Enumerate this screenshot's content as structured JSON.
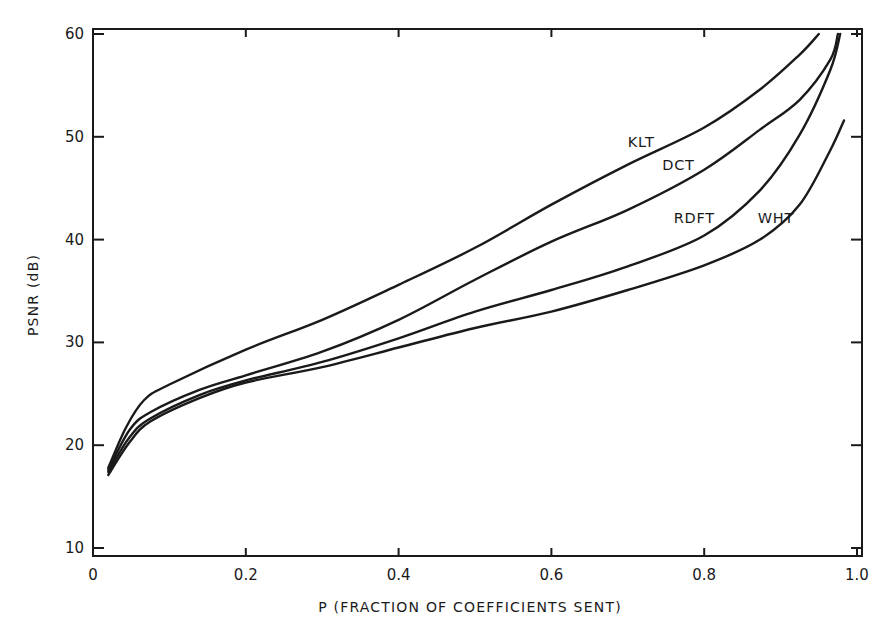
{
  "chart_data": {
    "type": "line",
    "title": "",
    "xlabel": "P (FRACTION OF COEFFICIENTS SENT)",
    "ylabel": "PSNR (dB)",
    "xlim": [
      0,
      1.0
    ],
    "ylim": [
      10,
      60
    ],
    "grid": false,
    "legend": "inline labels near curves",
    "x_ticks": [
      "0",
      "0.2",
      "0.4",
      "0.6",
      "0.8",
      "1.0"
    ],
    "y_ticks": [
      "10",
      "20",
      "30",
      "40",
      "50",
      "60"
    ],
    "series": [
      {
        "name": "KLT",
        "x": [
          0.02,
          0.043,
          0.067,
          0.1,
          0.2,
          0.3,
          0.4,
          0.5,
          0.6,
          0.7,
          0.8,
          0.873,
          0.925,
          0.95
        ],
        "y": [
          17.8,
          21.7,
          24.4,
          25.9,
          29.3,
          32.2,
          35.6,
          39.2,
          43.4,
          47.3,
          50.9,
          54.6,
          58.0,
          60.0
        ]
      },
      {
        "name": "DCT",
        "x": [
          0.02,
          0.048,
          0.075,
          0.14,
          0.2,
          0.3,
          0.4,
          0.5,
          0.6,
          0.7,
          0.8,
          0.873,
          0.925,
          0.965,
          0.975
        ],
        "y": [
          17.6,
          21.5,
          23.2,
          25.4,
          26.8,
          29.1,
          32.2,
          36.1,
          39.8,
          42.9,
          46.8,
          50.7,
          53.6,
          57.5,
          60.0
        ]
      },
      {
        "name": "RDFT",
        "x": [
          0.02,
          0.048,
          0.075,
          0.14,
          0.2,
          0.3,
          0.4,
          0.5,
          0.6,
          0.7,
          0.8,
          0.873,
          0.925,
          0.965,
          0.978
        ],
        "y": [
          17.4,
          20.8,
          22.6,
          24.9,
          26.3,
          28.1,
          30.4,
          33.0,
          35.1,
          37.4,
          40.4,
          44.8,
          50.2,
          56.5,
          60.0
        ]
      },
      {
        "name": "WHT",
        "x": [
          0.02,
          0.048,
          0.075,
          0.14,
          0.2,
          0.3,
          0.4,
          0.5,
          0.6,
          0.7,
          0.8,
          0.873,
          0.925,
          0.965,
          0.983
        ],
        "y": [
          17.1,
          20.3,
          22.3,
          24.6,
          26.1,
          27.6,
          29.5,
          31.4,
          33.0,
          35.1,
          37.5,
          40.0,
          43.4,
          48.7,
          51.6
        ]
      }
    ],
    "annotations": [
      {
        "text": "KLT",
        "x": 0.7,
        "y": 49.0
      },
      {
        "text": "DCT",
        "x": 0.745,
        "y": 46.8
      },
      {
        "text": "RDFT",
        "x": 0.76,
        "y": 41.6
      },
      {
        "text": "WHT",
        "x": 0.87,
        "y": 41.6
      }
    ]
  }
}
